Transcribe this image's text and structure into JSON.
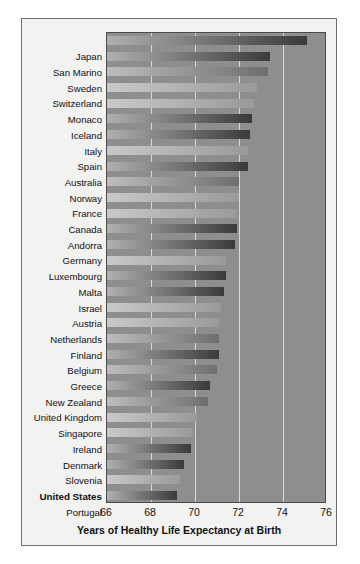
{
  "chart_data": {
    "type": "bar",
    "orientation": "horizontal",
    "title": "",
    "xlabel": "Years of Healthy Life Expectancy at Birth",
    "ylabel": "",
    "xlim": [
      66,
      76
    ],
    "xticks": [
      66,
      68,
      70,
      72,
      74,
      76
    ],
    "grid": true,
    "legend": null,
    "highlight_category": "United States",
    "categories": [
      "Japan",
      "San Marino",
      "Sweden",
      "Switzerland",
      "Monaco",
      "Iceland",
      "Italy",
      "Spain",
      "Australia",
      "Norway",
      "France",
      "Canada",
      "Andorra",
      "Germany",
      "Luxembourg",
      "Malta",
      "Israel",
      "Austria",
      "Netherlands",
      "Finland",
      "Belgium",
      "Greece",
      "New Zealand",
      "United Kingdom",
      "Singapore",
      "Ireland",
      "Denmark",
      "Slovenia",
      "United States",
      "Portugal"
    ],
    "values": [
      75.1,
      73.4,
      73.3,
      72.8,
      72.7,
      72.6,
      72.5,
      72.4,
      72.4,
      72.0,
      72.0,
      71.9,
      71.9,
      71.8,
      71.4,
      71.4,
      71.3,
      71.2,
      71.1,
      71.1,
      71.1,
      71.0,
      70.7,
      70.6,
      70.1,
      69.9,
      69.8,
      69.5,
      69.3,
      69.2
    ],
    "bar_shade": [
      "dark",
      "dark",
      "mid",
      "light",
      "light",
      "dark",
      "dark",
      "light",
      "dark",
      "mid",
      "light",
      "light",
      "dark",
      "dark",
      "light",
      "dark",
      "dark",
      "light",
      "light",
      "mid",
      "dark",
      "mid",
      "dark",
      "mid",
      "light",
      "light",
      "dark",
      "dark",
      "light",
      "dark"
    ]
  },
  "colors": {
    "plot_background": "#8e8e8e",
    "figure_background": "#f2f2f1",
    "gridline": "#d9d9d9",
    "axis_border": "#4a4a4a",
    "text": "#111111",
    "bar_light_start": "#c9c9c9",
    "bar_light_end": "#9a9a9a",
    "bar_mid_start": "#bdbdbd",
    "bar_mid_end": "#6e6e6e",
    "bar_dark_start": "#b0b0b0",
    "bar_dark_end": "#3a3a3a"
  }
}
